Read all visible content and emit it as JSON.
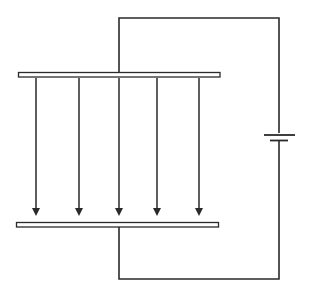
{
  "diagram": {
    "components": {
      "top_plate": {
        "label": "positive plate"
      },
      "bottom_plate": {
        "label": "negative plate"
      },
      "battery": {
        "label": "battery"
      },
      "wire": {
        "label": "circuit wire"
      }
    },
    "field": {
      "direction": "down",
      "arrow_count": 5,
      "arrows": [
        {
          "id": 1
        },
        {
          "id": 2
        },
        {
          "id": 3
        },
        {
          "id": 4
        },
        {
          "id": 5
        }
      ]
    },
    "colors": {
      "line": "#2a2a2a",
      "plate_fill": "#ffffff",
      "background": "#ffffff"
    }
  }
}
